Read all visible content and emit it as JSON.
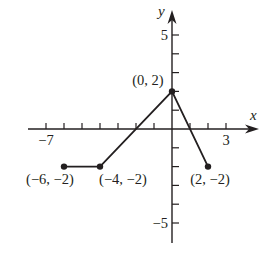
{
  "chart_data": {
    "type": "line",
    "title": "",
    "xlabel": "x",
    "ylabel": "y",
    "xlim": [
      -7,
      3
    ],
    "ylim": [
      -5,
      5
    ],
    "grid": false,
    "x_tick_labels": [
      {
        "value": -7,
        "label": "−7"
      },
      {
        "value": 3,
        "label": "3"
      }
    ],
    "y_tick_labels": [
      {
        "value": 5,
        "label": "5"
      },
      {
        "value": -5,
        "label": "−5"
      }
    ],
    "x_ticks": [
      -7,
      -6,
      -5,
      -4,
      -3,
      -2,
      -1,
      1,
      2,
      3
    ],
    "y_ticks": [
      -5,
      -4,
      -3,
      -2,
      -1,
      1,
      2,
      3,
      4,
      5
    ],
    "series": [
      {
        "name": "f(x)",
        "x": [
          -6,
          -4,
          0,
          2
        ],
        "y": [
          -2,
          -2,
          2,
          -2
        ],
        "endpoints_closed": true
      }
    ],
    "annotations": [
      {
        "point": [
          -6,
          -2
        ],
        "text": "(−6, −2)"
      },
      {
        "point": [
          -4,
          -2
        ],
        "text": "(−4, −2)"
      },
      {
        "point": [
          0,
          2
        ],
        "text": "(0, 2)"
      },
      {
        "point": [
          2,
          -2
        ],
        "text": "(2, −2)"
      }
    ]
  },
  "style": {
    "ink": "#231f20",
    "background": "#ffffff"
  }
}
